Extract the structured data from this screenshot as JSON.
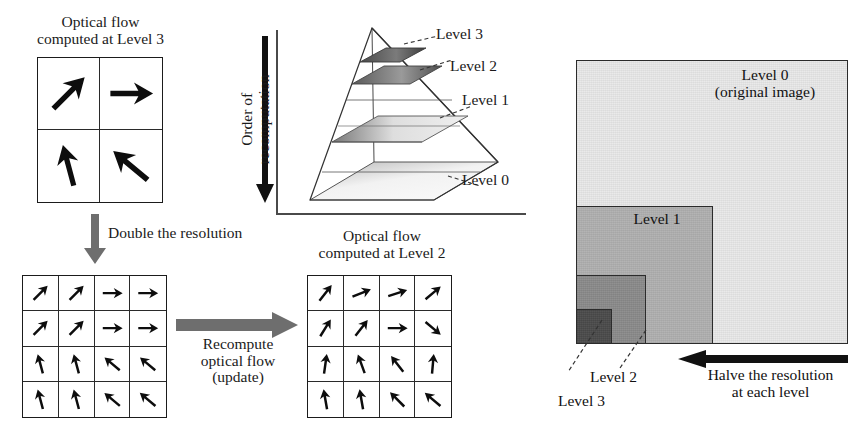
{
  "left_panel": {
    "top_caption": "Optical flow\ncomputed at Level 3",
    "level3_grid": {
      "name": "level-3-flow-grid",
      "rows": 2,
      "cols": 2,
      "arrows": [
        {
          "cell": "r1c1",
          "angle_deg": 45,
          "length": 1.0
        },
        {
          "cell": "r1c2",
          "angle_deg": 0,
          "length": 0.95
        },
        {
          "cell": "r2c1",
          "angle_deg": 105,
          "length": 0.95
        },
        {
          "cell": "r2c2",
          "angle_deg": 140,
          "length": 1.0
        }
      ]
    },
    "double_resolution_label": "Double the resolution",
    "double_resolution_arrow": "down-arrow-gray",
    "level2_grid_left": {
      "name": "upsampled-flow-grid",
      "rows": 4,
      "cols": 4,
      "arrows": [
        {
          "cell": "r1c1",
          "angle_deg": 45
        },
        {
          "cell": "r1c2",
          "angle_deg": 45
        },
        {
          "cell": "r1c3",
          "angle_deg": 0
        },
        {
          "cell": "r1c4",
          "angle_deg": 0
        },
        {
          "cell": "r2c1",
          "angle_deg": 45
        },
        {
          "cell": "r2c2",
          "angle_deg": 45
        },
        {
          "cell": "r2c3",
          "angle_deg": 0
        },
        {
          "cell": "r2c4",
          "angle_deg": 0
        },
        {
          "cell": "r3c1",
          "angle_deg": 105
        },
        {
          "cell": "r3c2",
          "angle_deg": 105
        },
        {
          "cell": "r3c3",
          "angle_deg": 140
        },
        {
          "cell": "r3c4",
          "angle_deg": 140
        },
        {
          "cell": "r4c1",
          "angle_deg": 105
        },
        {
          "cell": "r4c2",
          "angle_deg": 105
        },
        {
          "cell": "r4c3",
          "angle_deg": 140
        },
        {
          "cell": "r4c4",
          "angle_deg": 140
        }
      ]
    },
    "recompute_label": "Recompute\noptical flow\n(update)",
    "recompute_arrow": "right-arrow-gray",
    "right_caption": "Optical flow\ncomputed at Level 2",
    "level2_grid_right": {
      "name": "level-2-flow-grid",
      "rows": 4,
      "cols": 4,
      "arrows": [
        {
          "cell": "r1c1",
          "angle_deg": 52
        },
        {
          "cell": "r1c2",
          "angle_deg": 22
        },
        {
          "cell": "r1c3",
          "angle_deg": 18
        },
        {
          "cell": "r1c4",
          "angle_deg": 40
        },
        {
          "cell": "r2c1",
          "angle_deg": 58
        },
        {
          "cell": "r2c2",
          "angle_deg": 52
        },
        {
          "cell": "r2c3",
          "angle_deg": 0
        },
        {
          "cell": "r2c4",
          "angle_deg": -40
        },
        {
          "cell": "r3c1",
          "angle_deg": 82
        },
        {
          "cell": "r3c2",
          "angle_deg": 110
        },
        {
          "cell": "r3c3",
          "angle_deg": 128
        },
        {
          "cell": "r3c4",
          "angle_deg": 85
        },
        {
          "cell": "r4c1",
          "angle_deg": 100
        },
        {
          "cell": "r4c2",
          "angle_deg": 100
        },
        {
          "cell": "r4c3",
          "angle_deg": 135
        },
        {
          "cell": "r4c4",
          "angle_deg": 140
        }
      ]
    }
  },
  "middle_panel": {
    "axis_label": "Order of\nrecomputation",
    "axis_arrow": "down-arrow-black",
    "pyramid": {
      "name": "image-pyramid",
      "level_labels": [
        "Level 3",
        "Level 2",
        "Level 1",
        "Level 0"
      ],
      "leader_lines": 4
    }
  },
  "right_panel": {
    "level0_label": "Level 0\n(original image)",
    "level1_label": "Level 1",
    "level2_label": "Level 2",
    "level3_label": "Level 3",
    "halve_label": "Halve the resolution\nat each level",
    "halve_arrow": "left-arrow-black",
    "colors": {
      "level0": "#e8e8e8",
      "level1": "#b0b0b0",
      "level2": "#8a8a8a",
      "level3": "#4a4a4a",
      "border": "#2b2b2b"
    }
  }
}
